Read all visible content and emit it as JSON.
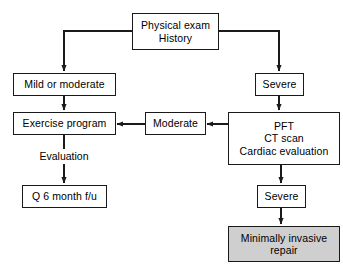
{
  "diagram": {
    "background_color": "#ffffff",
    "line_color": "#1a1a1a",
    "text_color": "#000000",
    "shaded_fill": "#cfcfcf",
    "nodes": {
      "physical_exam": {
        "line1": "Physical exam",
        "line2": "History"
      },
      "mild_or_moderate": {
        "line1": "Mild or moderate"
      },
      "severe_top": {
        "line1": "Severe"
      },
      "exercise_program": {
        "line1": "Exercise program"
      },
      "moderate": {
        "line1": "Moderate"
      },
      "workup": {
        "line1": "PFT",
        "line2": "CT scan",
        "line3": "Cardiac evaluation"
      },
      "followup": {
        "line1": "Q 6 month f/u"
      },
      "severe_bottom": {
        "line1": "Severe"
      },
      "minimally_invasive": {
        "line1": "Minimally invasive",
        "line2": "repair"
      }
    },
    "edge_labels": {
      "evaluation": "Evaluation"
    }
  }
}
